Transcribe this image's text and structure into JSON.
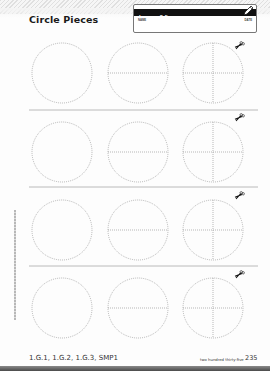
{
  "header": {
    "title": "Circle Pieces",
    "lesson": "Lesson 8-5",
    "name_label": "NAME",
    "date_label": "DATE",
    "icon": "pencil-icon"
  },
  "worksheet": {
    "rows": [
      {
        "circles": [
          "whole",
          "halves",
          "fourths"
        ],
        "cut_icon": "scissors-icon"
      },
      {
        "circles": [
          "whole",
          "halves",
          "fourths"
        ],
        "cut_icon": "scissors-icon"
      },
      {
        "circles": [
          "whole",
          "halves",
          "fourths"
        ],
        "cut_icon": "scissors-icon"
      },
      {
        "circles": [
          "whole",
          "halves",
          "fourths"
        ],
        "cut_icon": "scissors-icon"
      }
    ],
    "line_color": "#8a8a8a",
    "divider_color": "#a8a8a8"
  },
  "sidebar": {
    "copyright": "Copyright © McGraw-Hill Education. Permission is granted to reproduce for classroom use."
  },
  "footer": {
    "standards": "1.G.1, 1.G.2, 1.G.3, SMP1",
    "page_words": "two hundred thirty-five",
    "page_number": "235"
  }
}
